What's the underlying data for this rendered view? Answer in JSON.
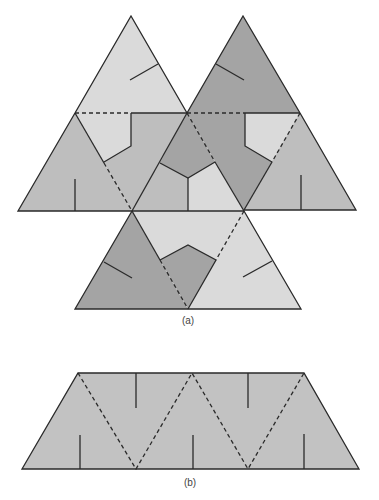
{
  "figure": {
    "panels": [
      {
        "id": "a",
        "caption": "(a)",
        "description": "Unfolded net of four triangles with colored pieces and crease lines"
      },
      {
        "id": "b",
        "caption": "(b)",
        "description": "Trapezoid strip of five triangles with dashed fold lines and slits"
      }
    ],
    "colors": {
      "light": "#dadada",
      "medium": "#bebebe",
      "dark": "#a4a4a4",
      "line": "#2a2a2a",
      "background": "#ffffff"
    },
    "legend": {
      "solid_line": "cut / edge",
      "dashed_line": "fold"
    }
  }
}
